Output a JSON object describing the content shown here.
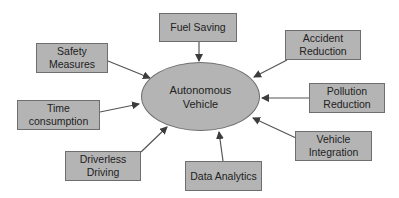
{
  "diagram": {
    "center": {
      "label": "Autonomous\nVehicle"
    },
    "nodes": [
      {
        "id": "safety",
        "label": "Safety\nMeasures"
      },
      {
        "id": "fuel",
        "label": "Fuel Saving"
      },
      {
        "id": "accident",
        "label": "Accident\nReduction"
      },
      {
        "id": "pollution",
        "label": "Pollution\nReduction"
      },
      {
        "id": "time",
        "label": "Time\nconsumption"
      },
      {
        "id": "integration",
        "label": "Vehicle\nIntegration"
      },
      {
        "id": "driverless",
        "label": "Driverless\nDriving"
      },
      {
        "id": "analytics",
        "label": "Data Analytics"
      }
    ],
    "edges": [
      {
        "from": "safety",
        "to": "center"
      },
      {
        "from": "fuel",
        "to": "center"
      },
      {
        "from": "accident",
        "to": "center"
      },
      {
        "from": "pollution",
        "to": "center"
      },
      {
        "from": "time",
        "to": "center"
      },
      {
        "from": "integration",
        "to": "center"
      },
      {
        "from": "driverless",
        "to": "center"
      },
      {
        "from": "analytics",
        "to": "center"
      }
    ],
    "colors": {
      "fill": "#b4b4b4",
      "border": "#6e6e6e",
      "arrow": "#4a4a4a",
      "text": "#222222"
    }
  }
}
